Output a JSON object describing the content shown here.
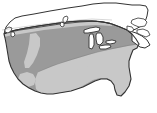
{
  "figure": {
    "kind": "thematic-map",
    "title": "Contiguous United States shaded relief map",
    "background_color": "#ffffff",
    "outline_color": "#333333",
    "width": 157,
    "height": 113
  },
  "regions": [
    {
      "id": "canada",
      "label": "Canada",
      "fill": "#ffffff",
      "stroke": "#333333",
      "interactable": false
    },
    {
      "id": "us-medium-zone",
      "label": "Western, Midwestern and Northeastern United States",
      "fill": "#9a9a9a",
      "stroke": "#333333",
      "interactable": false
    },
    {
      "id": "us-light-zone",
      "label": "Southern United States and northern border band",
      "fill": "#c8c8c8",
      "stroke": "none",
      "interactable": false
    },
    {
      "id": "great-lakes",
      "label": "Great Lakes",
      "fill": "#ffffff",
      "stroke": "#333333",
      "interactable": false
    },
    {
      "id": "lake-winnipeg",
      "label": "Lake Winnipeg",
      "fill": "#ffffff",
      "stroke": "#333333",
      "interactable": false
    },
    {
      "id": "puget-sound",
      "label": "Puget Sound and Vancouver Island",
      "fill": "#ffffff",
      "stroke": "#333333",
      "interactable": false
    },
    {
      "id": "gulf-of-st-lawrence",
      "label": "Gulf of Saint Lawrence and Nova Scotia",
      "fill": "#ffffff",
      "stroke": "#333333",
      "interactable": false
    }
  ],
  "shading_legend": {
    "caption": "",
    "entries": [
      {
        "swatch": "#9a9a9a",
        "label": ""
      },
      {
        "swatch": "#c8c8c8",
        "label": ""
      }
    ]
  }
}
